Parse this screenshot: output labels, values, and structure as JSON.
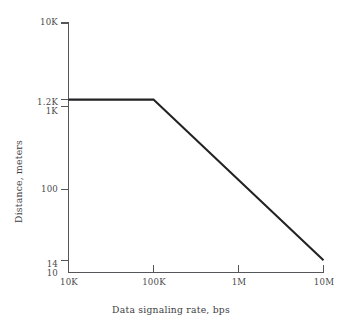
{
  "chart_data": {
    "type": "line",
    "title": "",
    "xlabel": "Data signaling rate, bps",
    "ylabel": "Distance, meters",
    "xscale": "log",
    "yscale": "log",
    "xlim": [
      10000,
      10000000
    ],
    "ylim": [
      10,
      10000
    ],
    "grid": false,
    "legend": null,
    "x_ticks": [
      {
        "value": 10000,
        "label": "10K"
      },
      {
        "value": 100000,
        "label": "100K"
      },
      {
        "value": 1000000,
        "label": "1M"
      },
      {
        "value": 10000000,
        "label": "10M"
      }
    ],
    "y_ticks": [
      {
        "value": 10000,
        "label": "10K"
      },
      {
        "value": 1200,
        "label": "1.2K"
      },
      {
        "value": 1000,
        "label": "1K"
      },
      {
        "value": 100,
        "label": "100"
      },
      {
        "value": 14,
        "label": "14"
      },
      {
        "value": 10,
        "label": "10"
      }
    ],
    "series": [
      {
        "name": "maximum distance",
        "points": [
          {
            "x": 10000,
            "y": 1200
          },
          {
            "x": 100000,
            "y": 1200
          },
          {
            "x": 10000000,
            "y": 14
          }
        ]
      }
    ],
    "colors": {
      "line": "#222225",
      "axis": "#55565a",
      "text": "#4a4a4c",
      "background": "#ffffff"
    }
  }
}
